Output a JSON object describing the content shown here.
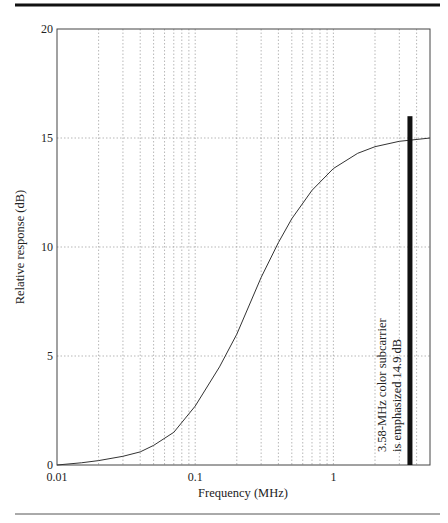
{
  "chart_data": {
    "type": "line",
    "title": "",
    "xlabel": "Frequency (MHz)",
    "ylabel": "Relative response (dB)",
    "xscale": "log",
    "xlim": [
      0.01,
      5
    ],
    "ylim": [
      0,
      20
    ],
    "grid": true,
    "x_ticks": [
      {
        "value": 0.01,
        "label": "0.01"
      },
      {
        "value": 0.1,
        "label": "0.1"
      },
      {
        "value": 1,
        "label": "1"
      }
    ],
    "y_ticks": [
      {
        "value": 0,
        "label": "0"
      },
      {
        "value": 5,
        "label": "5"
      },
      {
        "value": 10,
        "label": "10"
      },
      {
        "value": 15,
        "label": "15"
      },
      {
        "value": 20,
        "label": "20"
      }
    ],
    "series": [
      {
        "name": "Relative response",
        "x": [
          0.01,
          0.015,
          0.02,
          0.03,
          0.04,
          0.05,
          0.07,
          0.1,
          0.15,
          0.2,
          0.3,
          0.4,
          0.5,
          0.7,
          1,
          1.5,
          2,
          3,
          3.58,
          5
        ],
        "y": [
          0.0,
          0.1,
          0.2,
          0.4,
          0.6,
          0.9,
          1.5,
          2.7,
          4.5,
          6.0,
          8.6,
          10.2,
          11.3,
          12.6,
          13.6,
          14.3,
          14.6,
          14.85,
          14.9,
          15.0
        ]
      }
    ],
    "marker_bar": {
      "x": 3.58,
      "y_top": 16
    },
    "annotation": {
      "line1": "3.58-MHz color subcarrier",
      "line2": "is emphasized 14.9 dB"
    }
  }
}
